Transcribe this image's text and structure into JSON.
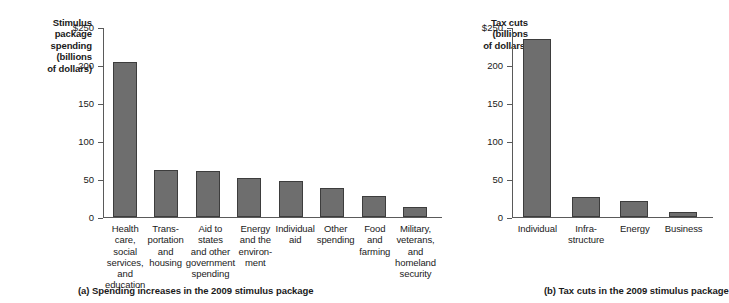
{
  "figure": {
    "background": "#ffffff",
    "bar_fill": "#6e6e6e",
    "bar_stroke": "#3d3d3d",
    "axis_color": "#5a5a5a"
  },
  "panel_a": {
    "caption": "(a) Spending increases in the 2009 stimulus package",
    "axis_title": "Stimulus\npackage\nspending\n(billions\nof dollars)"
  },
  "panel_b": {
    "caption": "(b) Tax cuts in the 2009 stimulus package",
    "axis_title": "Tax cuts\n(billions\nof dollars)"
  },
  "chart_data": [
    {
      "type": "bar",
      "title": "(a) Spending increases in the 2009 stimulus package",
      "xlabel": "",
      "ylabel": "Stimulus package spending (billions of dollars)",
      "ylim": [
        0,
        250
      ],
      "yticks": [
        0,
        50,
        100,
        150,
        200,
        250
      ],
      "ytick_labels": [
        "0",
        "50",
        "100",
        "150",
        "200",
        "$250"
      ],
      "grid": false,
      "legend": "none",
      "categories": [
        "Health care,\nsocial services,\nand education",
        "Trans-\nportation\nand\nhousing",
        "Aid to states\nand other\ngovernment\nspending",
        "Energy\nand the\nenviron-\nment",
        "Individual\naid",
        "Other\nspending",
        "Food\nand\nfarming",
        "Military,\nveterans,\nand\nhomeland\nsecurity"
      ],
      "values": [
        205,
        62,
        61,
        51,
        47,
        38,
        28,
        13
      ]
    },
    {
      "type": "bar",
      "title": "(b) Tax cuts in the 2009 stimulus package",
      "xlabel": "",
      "ylabel": "Tax cuts (billions of dollars)",
      "ylim": [
        0,
        250
      ],
      "yticks": [
        0,
        50,
        100,
        150,
        200,
        250
      ],
      "ytick_labels": [
        "0",
        "50",
        "100",
        "150",
        "200",
        "$250"
      ],
      "grid": false,
      "legend": "none",
      "categories": [
        "Individual",
        "Infra-\nstructure",
        "Energy",
        "Business"
      ],
      "values": [
        236,
        27,
        21,
        7
      ]
    }
  ]
}
